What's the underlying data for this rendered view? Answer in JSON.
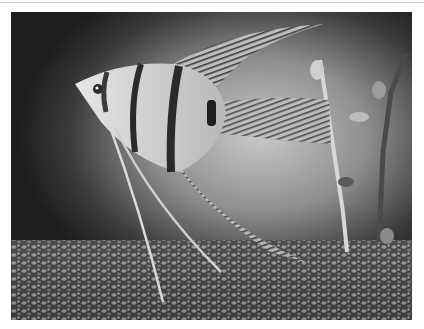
{
  "image": {
    "alt": "Black and white photograph of an angelfish swimming above aquarium gravel with plants in the background",
    "subject": "angelfish",
    "palette": {
      "background_dark": "#1e1e1e",
      "background_light": "#c9c9c9",
      "fish_body": "#d8d8d8",
      "stripe": "#2a2a2a",
      "gravel_dark": "#2b2b2b",
      "gravel_light": "#9a9a9a"
    }
  }
}
